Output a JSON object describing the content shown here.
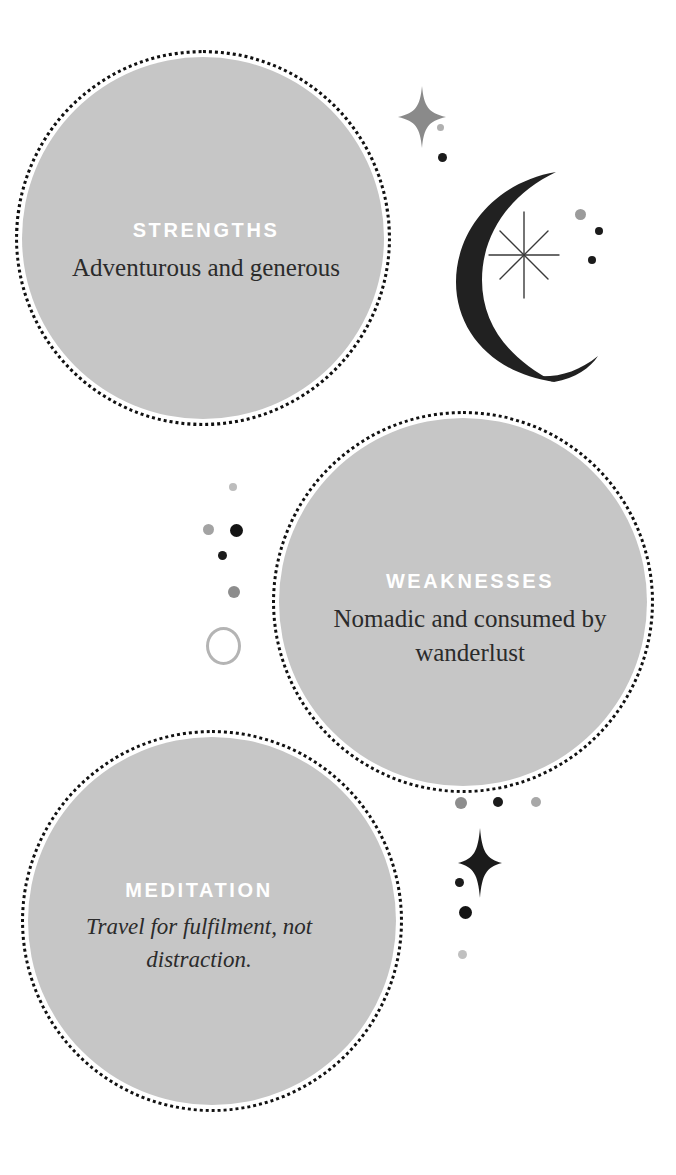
{
  "page": {
    "background_color": "#ffffff",
    "bubble_fill_color": "#c6c6c6",
    "bubble_border_color": "#111111",
    "heading_color": "#ffffff",
    "body_color": "#2b2b2b",
    "moon_color": "#212121",
    "sparkle_gray_color": "#8a8a8a",
    "sparkle_dark_color": "#1b1b1b"
  },
  "bubbles": [
    {
      "id": "strengths",
      "heading": "STRENGTHS",
      "body": "Adventurous and generous",
      "style": "upright"
    },
    {
      "id": "weaknesses",
      "heading": "WEAKNESSES",
      "body": "Nomadic and consumed by wanderlust",
      "style": "upright"
    },
    {
      "id": "meditation",
      "heading": "MEDITATION",
      "body": "Travel for fulfilment, not distraction.",
      "style": "italic"
    }
  ],
  "decorations": {
    "moon": {
      "name": "crescent-moon",
      "color": "#212121"
    },
    "starburst": {
      "name": "eight-point-starburst",
      "color": "#3a3a3a"
    },
    "sparkle_top": {
      "name": "four-point-sparkle-gray",
      "color": "#8a8a8a"
    },
    "sparkle_bottom": {
      "name": "four-point-sparkle-dark",
      "color": "#1b1b1b"
    },
    "ring": {
      "name": "hollow-ring-outline",
      "color": "#b4b4b4"
    },
    "dots": [
      {
        "color": "#a9a9a9",
        "size": 7
      },
      {
        "color": "#1b1b1b",
        "size": 9
      },
      {
        "color": "#8f8f8f",
        "size": 11
      },
      {
        "color": "#1b1b1b",
        "size": 8
      },
      {
        "color": "#9a9a9a",
        "size": 10
      }
    ]
  }
}
